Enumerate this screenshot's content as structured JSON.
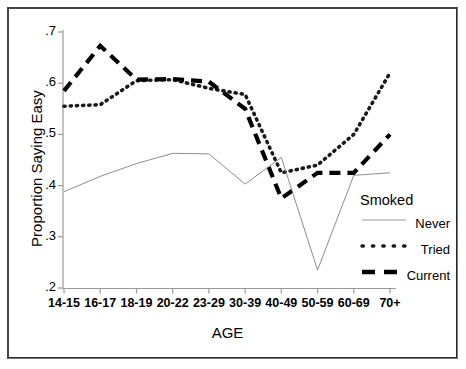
{
  "chart_data": {
    "type": "line",
    "title": "",
    "xlabel": "AGE",
    "ylabel": "Proportion Saying Easy",
    "categories": [
      "14-15",
      "16-17",
      "18-19",
      "20-22",
      "23-29",
      "30-39",
      "40-49",
      "50-59",
      "60-69",
      "70+"
    ],
    "ylim": [
      0.2,
      0.7
    ],
    "yticks": [
      ".2",
      ".3",
      ".4",
      ".5",
      ".6",
      ".7"
    ],
    "ytick_values": [
      0.2,
      0.3,
      0.4,
      0.5,
      0.6,
      0.7
    ],
    "grid": false,
    "legend_position": "right-inside",
    "legend_title": "Smoked",
    "series": [
      {
        "name": "Never",
        "style": "dotted",
        "color": "#1a1a1a",
        "values": [
          0.555,
          0.558,
          0.605,
          0.607,
          0.59,
          0.578,
          0.425,
          0.44,
          0.5,
          0.62
        ]
      },
      {
        "name": "Tried",
        "style": "dashed",
        "color": "#000000",
        "values": [
          0.585,
          0.673,
          0.607,
          0.608,
          0.603,
          0.55,
          0.375,
          0.425,
          0.425,
          0.5
        ]
      },
      {
        "name": "Current",
        "style": "solid-thin",
        "color": "#808080",
        "values": [
          0.388,
          0.418,
          0.443,
          0.463,
          0.462,
          0.403,
          0.455,
          0.235,
          0.42,
          0.425
        ]
      }
    ]
  },
  "axes": {
    "y_title": "Proportion Saying Easy",
    "x_title": "AGE"
  },
  "legend": {
    "title": "Smoked",
    "entries": [
      {
        "label": "Never",
        "swatch": "solid-thin-line-swatch"
      },
      {
        "label": "Tried",
        "swatch": "dotted-line-swatch"
      },
      {
        "label": "Current",
        "swatch": "dashed-line-swatch"
      }
    ]
  }
}
